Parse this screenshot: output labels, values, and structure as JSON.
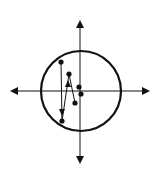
{
  "diagram": {
    "title": "",
    "canvas": {
      "width": 163,
      "height": 172,
      "background": "#ffffff"
    },
    "stroke_color": "#111111",
    "axes": {
      "center": [
        80,
        91
      ],
      "horizontal": {
        "x1": 12,
        "x2": 148,
        "y": 91,
        "arrows": "both"
      },
      "vertical": {
        "x": 80,
        "y1": 22,
        "y2": 162,
        "arrows": "both"
      }
    },
    "circle": {
      "cx": 81,
      "cy": 91,
      "r": 40,
      "stroke_width": 2.2
    },
    "path_points": [
      {
        "x": 61,
        "y": 62
      },
      {
        "x": 62,
        "y": 121
      },
      {
        "x": 69,
        "y": 74
      },
      {
        "x": 75,
        "y": 103
      }
    ],
    "isolated_points": [
      {
        "x": 79,
        "y": 87
      },
      {
        "x": 81,
        "y": 94
      }
    ],
    "path_arrows": [
      {
        "at": [
          62,
          114
        ],
        "direction": "down"
      },
      {
        "at": [
          68,
          82
        ],
        "direction": "up"
      }
    ],
    "point_radius": 2.6
  }
}
